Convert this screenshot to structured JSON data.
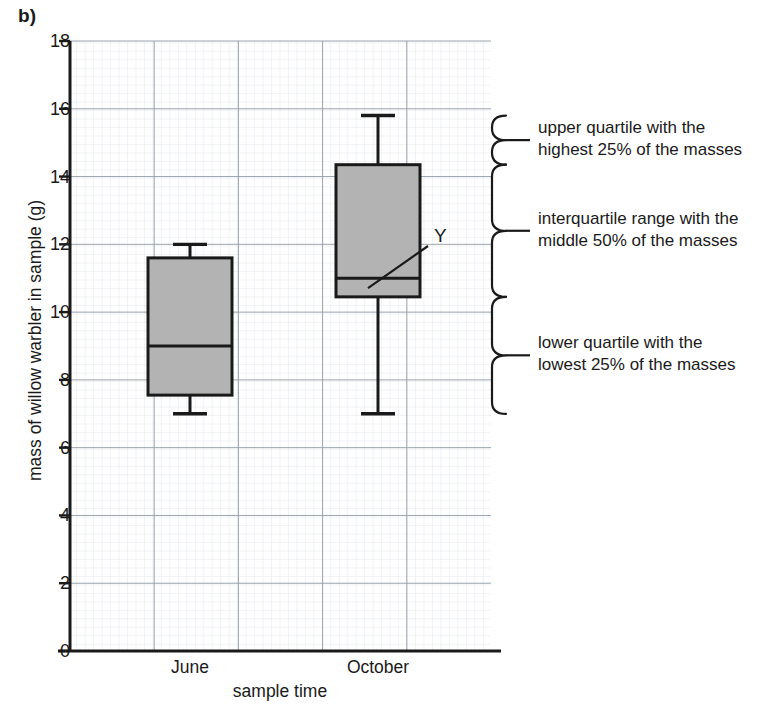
{
  "panel_label": "b)",
  "chart_data": {
    "type": "box",
    "title": "",
    "xlabel": "sample time",
    "ylabel": "mass of willow warbler in sample (g)",
    "ylim": [
      0,
      18
    ],
    "ytick_step": 2,
    "yticks": [
      "0",
      "2",
      "4",
      "6",
      "8",
      "10",
      "12",
      "14",
      "16",
      "18"
    ],
    "grid": "minor graph paper grid with major gridlines every 2 units",
    "categories": [
      "June",
      "October"
    ],
    "boxes": [
      {
        "category": "June",
        "min": 7.0,
        "q1": 7.55,
        "median": 9.0,
        "q3": 11.6,
        "max": 12.0
      },
      {
        "category": "October",
        "min": 7.0,
        "q1": 10.45,
        "median": 11.0,
        "q3": 14.35,
        "max": 15.8
      }
    ],
    "box_fill": "#b3b3b3",
    "box_stroke": "#1a1a1a",
    "point_annotations": [
      {
        "label": "Y",
        "target_category": "October",
        "target_value": 11.0
      }
    ],
    "braces": [
      {
        "id": "upper-quartile",
        "from_value": 14.35,
        "to_value": 15.8,
        "text_line1": "upper quartile with the",
        "text_line2": "highest 25% of the masses"
      },
      {
        "id": "interquartile-range",
        "from_value": 10.45,
        "to_value": 14.35,
        "text_line1": "interquartile range with the",
        "text_line2": "middle 50% of the masses"
      },
      {
        "id": "lower-quartile",
        "from_value": 7.0,
        "to_value": 10.45,
        "text_line1": "lower quartile with the",
        "text_line2": "lowest 25% of the masses"
      }
    ]
  }
}
